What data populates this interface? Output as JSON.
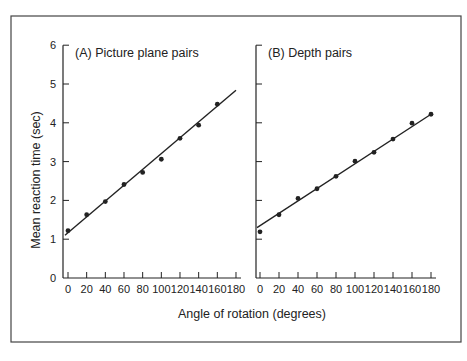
{
  "figure": {
    "frame": {
      "left": 11,
      "top": 16,
      "right": 461,
      "bottom": 342
    },
    "x_axis_title": "Angle of rotation (degrees)",
    "y_axis_title": "Mean reaction time (sec)",
    "colors": {
      "ink": "#222222",
      "background": "#ffffff",
      "frame": "#444444"
    }
  },
  "chart_data": [
    {
      "type": "scatter",
      "title": "(A) Picture plane pairs",
      "xlabel": "Angle of rotation (degrees)",
      "ylabel": "Mean reaction time (sec)",
      "x": [
        0,
        20,
        40,
        60,
        80,
        100,
        120,
        140,
        160
      ],
      "series": [
        {
          "name": "Observed mean RT",
          "values": [
            1.22,
            1.63,
            1.97,
            2.41,
            2.72,
            3.06,
            3.6,
            3.94,
            4.48
          ]
        }
      ],
      "fit_line": {
        "x": [
          0,
          180
        ],
        "y": [
          1.1,
          4.84
        ]
      },
      "xticks": [
        0,
        20,
        40,
        60,
        80,
        100,
        120,
        140,
        160,
        180
      ],
      "xtick_labels": [
        "0",
        "20",
        "40",
        "60",
        "80",
        "100",
        "120",
        "140",
        "160",
        "180"
      ],
      "yticks": [
        0,
        1,
        2,
        3,
        4,
        5,
        6
      ],
      "ytick_labels": [
        "0",
        "1",
        "2",
        "3",
        "4",
        "5",
        "6"
      ],
      "xlim": [
        0,
        180
      ],
      "ylim": [
        0,
        6
      ],
      "grid": false,
      "legend": null,
      "layout": {
        "x0_px": 68,
        "xscale": 0.9333,
        "axis_x_px": 63,
        "axis_end_px": 241,
        "y0_px": 278,
        "yscale": 38.8
      }
    },
    {
      "type": "scatter",
      "title": "(B) Depth pairs",
      "xlabel": "Angle of rotation (degrees)",
      "ylabel": "Mean reaction time (sec)",
      "x": [
        0,
        20,
        40,
        60,
        80,
        100,
        120,
        140,
        160,
        180
      ],
      "series": [
        {
          "name": "Observed mean RT",
          "values": [
            1.19,
            1.63,
            2.05,
            2.3,
            2.62,
            3.01,
            3.24,
            3.58,
            3.99,
            4.22
          ]
        }
      ],
      "fit_line": {
        "x": [
          0,
          180
        ],
        "y": [
          1.3,
          4.22
        ]
      },
      "xticks": [
        0,
        20,
        40,
        60,
        80,
        100,
        120,
        140,
        160,
        180
      ],
      "xtick_labels": [
        "0",
        "20",
        "40",
        "60",
        "80",
        "100",
        "120",
        "140",
        "160",
        "180"
      ],
      "yticks": [
        0,
        1,
        2,
        3,
        4,
        5,
        6
      ],
      "ytick_labels": [
        "",
        "",
        "",
        "",
        "",
        "",
        ""
      ],
      "xlim": [
        0,
        180
      ],
      "ylim": [
        0,
        6
      ],
      "grid": false,
      "legend": null,
      "layout": {
        "x0_px": 260,
        "xscale": 0.95,
        "axis_x_px": 256,
        "axis_end_px": 436,
        "y0_px": 278,
        "yscale": 38.8
      }
    }
  ]
}
